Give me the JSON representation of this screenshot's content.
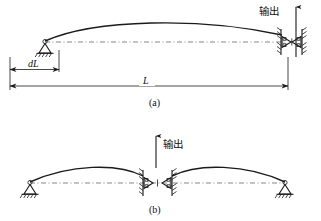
{
  "figure": {
    "background_color": "#ffffff",
    "line_color": "#1b1b1b",
    "centerline_color": "#555555"
  },
  "panel_a": {
    "caption": "(a)",
    "output_label": "输出",
    "output_arrow_direction": "up",
    "dimensions": [
      {
        "name": "dL",
        "label": "dL",
        "description": "incremental horizontal displacement at left support"
      },
      {
        "name": "L",
        "label": "L",
        "description": "total span length of the arch"
      }
    ],
    "supports": [
      {
        "name": "left-pin-support",
        "type": "pin",
        "position": "left"
      },
      {
        "name": "right-fixed-wall",
        "type": "hatched-wall",
        "position": "right"
      }
    ],
    "mechanism": {
      "name": "bow-tie-flexure",
      "location": "right-end",
      "type": "bowtie"
    }
  },
  "panel_b": {
    "caption": "(b)",
    "output_label": "输出",
    "output_arrow_direction": "up",
    "supports": [
      {
        "name": "left-pin-support",
        "type": "pin",
        "position": "left"
      },
      {
        "name": "right-pin-support",
        "type": "pin",
        "position": "right"
      }
    ],
    "mechanism": {
      "name": "bow-tie-flexure",
      "location": "center",
      "type": "bowtie"
    }
  }
}
